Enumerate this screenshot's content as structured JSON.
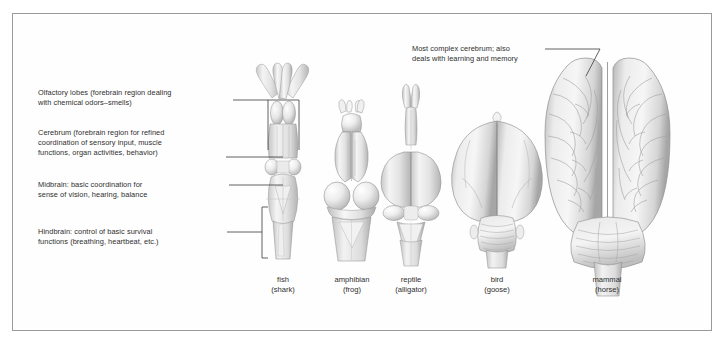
{
  "figure": {
    "background_color": "#ffffff",
    "border_color": "#9a9a9a",
    "line_color": "#3a3a3a",
    "text_color": "#2e2e2e"
  },
  "annotations": [
    {
      "id": "olfactory-lobes",
      "line1": "Olfactory lobes (forebrain region dealing",
      "line2": "with chemical odors–smells)",
      "line3": ""
    },
    {
      "id": "cerebrum",
      "line1": "Cerebrum (forebrain region for refined",
      "line2": "coordination of sensory input, muscle",
      "line3": "functions, organ activities, behavior)"
    },
    {
      "id": "midbrain",
      "line1": "Midbrain: basic coordination for",
      "line2": "sense of vision, hearing, balance",
      "line3": ""
    },
    {
      "id": "hindbrain",
      "line1": "Hindbrain: control of basic survival",
      "line2": "functions (breathing, heartbeat, etc.)",
      "line3": ""
    },
    {
      "id": "mammal-cerebrum",
      "line1": "Most complex cerebrum; also",
      "line2": "deals with learning and memory",
      "line3": ""
    }
  ],
  "specimens": [
    {
      "id": "fish",
      "common": "fish",
      "species": "(shark)"
    },
    {
      "id": "amphibian",
      "common": "amphibian",
      "species": "(frog)"
    },
    {
      "id": "reptile",
      "common": "reptile",
      "species": "(alligator)"
    },
    {
      "id": "bird",
      "common": "bird",
      "species": "(goose)"
    },
    {
      "id": "mammal",
      "common": "mammal",
      "species": "(horse)"
    }
  ]
}
